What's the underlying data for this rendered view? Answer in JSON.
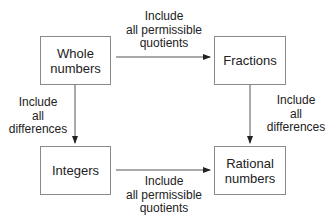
{
  "nodes": {
    "whole": {
      "line1": "Whole",
      "line2": "numbers"
    },
    "fractions": {
      "line1": "Fractions"
    },
    "integers": {
      "line1": "Integers"
    },
    "rational": {
      "line1": "Rational",
      "line2": "numbers"
    }
  },
  "edges": {
    "top": {
      "line1": "Include",
      "line2": "all permissible",
      "line3": "quotients"
    },
    "bottom": {
      "line1": "Include",
      "line2": "all permissible",
      "line3": "quotients"
    },
    "left": {
      "line1": "Include",
      "line2": "all",
      "line3": "differences"
    },
    "right": {
      "line1": "Include",
      "line2": "all",
      "line3": "differences"
    }
  },
  "colors": {
    "line": "#555555",
    "box_border": "#8a8a8a",
    "text": "#222222"
  }
}
